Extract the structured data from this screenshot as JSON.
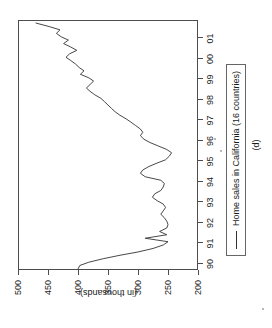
{
  "figure": {
    "caption": "(d)",
    "orientation_note": "rotated"
  },
  "chart_data": {
    "type": "line",
    "title": "",
    "xlabel": "",
    "ylabel": "(in thousands)",
    "ylim": [
      200,
      500
    ],
    "xlim": [
      1989.7,
      2001.9
    ],
    "grid": false,
    "legend_position": "below-plot",
    "legend": [
      "Home sales in California (16 countries)"
    ],
    "ytick_labels": [
      "200",
      "250",
      "300",
      "350",
      "400",
      "450",
      "500"
    ],
    "ytick_values": [
      200,
      250,
      300,
      350,
      400,
      450,
      500
    ],
    "xtick_labels": [
      "90",
      "91",
      "92",
      "93",
      "94",
      "95",
      "96",
      "97",
      "98",
      "99",
      "00",
      "01"
    ],
    "xtick_values": [
      1990,
      1991,
      1992,
      1993,
      1994,
      1995,
      1996,
      1997,
      1998,
      1999,
      2000,
      2001
    ],
    "series": [
      {
        "name": "Home sales in California (16 countries)",
        "color": "#333333",
        "x": [
          1989.75,
          1989.92,
          1990.08,
          1990.25,
          1990.42,
          1990.58,
          1990.75,
          1990.92,
          1991.08,
          1991.25,
          1991.42,
          1991.58,
          1991.75,
          1991.92,
          1992.08,
          1992.25,
          1992.42,
          1992.58,
          1992.75,
          1992.92,
          1993.08,
          1993.25,
          1993.42,
          1993.58,
          1993.75,
          1993.92,
          1994.08,
          1994.25,
          1994.42,
          1994.58,
          1994.75,
          1994.92,
          1995.08,
          1995.25,
          1995.42,
          1995.58,
          1995.75,
          1995.92,
          1996.08,
          1996.25,
          1996.42,
          1996.58,
          1996.75,
          1996.92,
          1997.08,
          1997.25,
          1997.42,
          1997.58,
          1997.75,
          1997.92,
          1998.08,
          1998.25,
          1998.42,
          1998.58,
          1998.75,
          1998.92,
          1999.08,
          1999.25,
          1999.42,
          1999.58,
          1999.75,
          1999.92,
          2000.08,
          2000.25,
          2000.42,
          2000.58,
          2000.75,
          2000.92,
          2001.08,
          2001.25,
          2001.42,
          2001.58,
          2001.75
        ],
        "y": [
          400,
          397,
          382,
          358,
          330,
          300,
          275,
          258,
          250,
          288,
          252,
          264,
          252,
          250,
          252,
          256,
          262,
          258,
          254,
          258,
          268,
          276,
          272,
          262,
          258,
          256,
          262,
          288,
          296,
          292,
          282,
          268,
          254,
          248,
          244,
          252,
          266,
          280,
          290,
          296,
          292,
          296,
          304,
          312,
          320,
          330,
          338,
          344,
          350,
          356,
          362,
          372,
          380,
          386,
          380,
          374,
          382,
          396,
          390,
          398,
          404,
          412,
          420,
          414,
          402,
          412,
          424,
          416,
          428,
          436,
          430,
          448,
          470
        ]
      }
    ]
  }
}
